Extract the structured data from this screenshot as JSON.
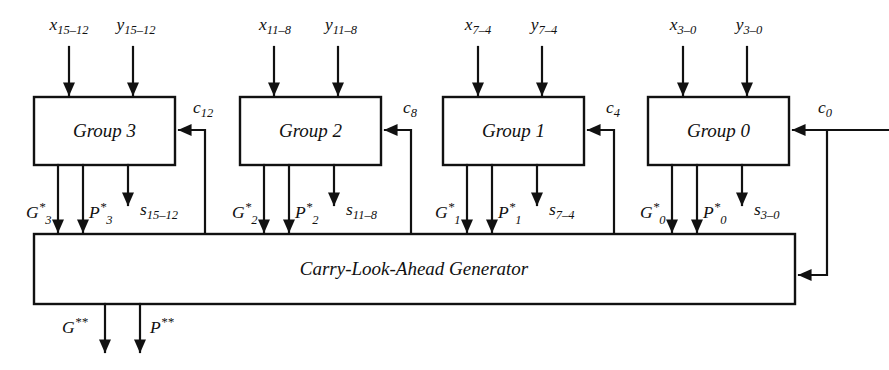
{
  "diagram": {
    "stroke_color": "#111111",
    "background_color": "#ffffff",
    "groups": [
      {
        "id": "group3",
        "label": "Group 3",
        "x_input": "x",
        "x_input_sub": "15–12",
        "y_input": "y",
        "y_input_sub": "15–12",
        "carry_in": "c",
        "carry_in_sub": "12",
        "g_out": "G",
        "g_out_star": "*",
        "g_out_sub": "3",
        "p_out": "P",
        "p_out_star": "*",
        "p_out_sub": "3",
        "sum_out": "s",
        "sum_out_sub": "15–12"
      },
      {
        "id": "group2",
        "label": "Group 2",
        "x_input": "x",
        "x_input_sub": "11–8",
        "y_input": "y",
        "y_input_sub": "11–8",
        "carry_in": "c",
        "carry_in_sub": "8",
        "g_out": "G",
        "g_out_star": "*",
        "g_out_sub": "2",
        "p_out": "P",
        "p_out_star": "*",
        "p_out_sub": "2",
        "sum_out": "s",
        "sum_out_sub": "11–8"
      },
      {
        "id": "group1",
        "label": "Group 1",
        "x_input": "x",
        "x_input_sub": "7–4",
        "y_input": "y",
        "y_input_sub": "7–4",
        "carry_in": "c",
        "carry_in_sub": "4",
        "g_out": "G",
        "g_out_star": "*",
        "g_out_sub": "1",
        "p_out": "P",
        "p_out_star": "*",
        "p_out_sub": "1",
        "sum_out": "s",
        "sum_out_sub": "7–4"
      },
      {
        "id": "group0",
        "label": "Group 0",
        "x_input": "x",
        "x_input_sub": "3–0",
        "y_input": "y",
        "y_input_sub": "3–0",
        "carry_in": "c",
        "carry_in_sub": "0",
        "g_out": "G",
        "g_out_star": "*",
        "g_out_sub": "0",
        "p_out": "P",
        "p_out_star": "*",
        "p_out_sub": "0",
        "sum_out": "s",
        "sum_out_sub": "3–0"
      }
    ],
    "generator": {
      "label": "Carry-Look-Ahead Generator",
      "outputs": [
        {
          "name": "G",
          "stars": "**"
        },
        {
          "name": "P",
          "stars": "**"
        }
      ]
    },
    "external_carry_in": {
      "name": "c",
      "sub": "0"
    }
  }
}
